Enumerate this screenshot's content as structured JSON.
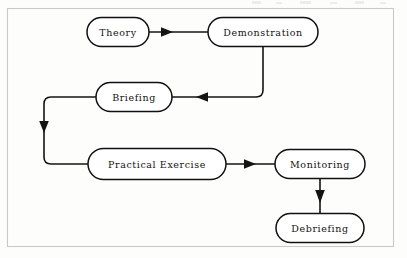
{
  "diagram": {
    "background_color": "#fdfdfc",
    "frame_color": "#c9c9c9",
    "node_outline_color": "#111111",
    "edge_color": "#141414",
    "text_color": "#131313",
    "nodes": [
      {
        "id": "theory",
        "label": "Theory",
        "cx": 118,
        "cy": 32,
        "w": 62,
        "h": 29
      },
      {
        "id": "demonstration",
        "label": "Demonstration",
        "cx": 263,
        "cy": 32,
        "w": 110,
        "h": 29
      },
      {
        "id": "briefing",
        "label": "Briefing",
        "cx": 134,
        "cy": 97,
        "w": 76,
        "h": 29
      },
      {
        "id": "practical-exercise",
        "label": "Practical Exercise",
        "cx": 157,
        "cy": 164,
        "w": 138,
        "h": 31
      },
      {
        "id": "monitoring",
        "label": "Monitoring",
        "cx": 320,
        "cy": 164,
        "w": 90,
        "h": 29
      },
      {
        "id": "debriefing",
        "label": "Debriefing",
        "cx": 320,
        "cy": 228,
        "w": 88,
        "h": 29
      }
    ],
    "edges": [
      {
        "id": "theory-to-demonstration",
        "from": "theory",
        "to": "demonstration",
        "direction": "right"
      },
      {
        "id": "demonstration-to-briefing",
        "from": "demonstration",
        "to": "briefing",
        "direction": "left"
      },
      {
        "id": "briefing-to-practical-exercise",
        "from": "briefing",
        "to": "practical-exercise",
        "direction": "down"
      },
      {
        "id": "practical-exercise-to-monitoring",
        "from": "practical-exercise",
        "to": "monitoring",
        "direction": "right"
      },
      {
        "id": "monitoring-to-debriefing",
        "from": "monitoring",
        "to": "debriefing",
        "direction": "down"
      }
    ],
    "frame": {
      "x": 7,
      "y": 8,
      "width": 387,
      "height": 239
    }
  }
}
